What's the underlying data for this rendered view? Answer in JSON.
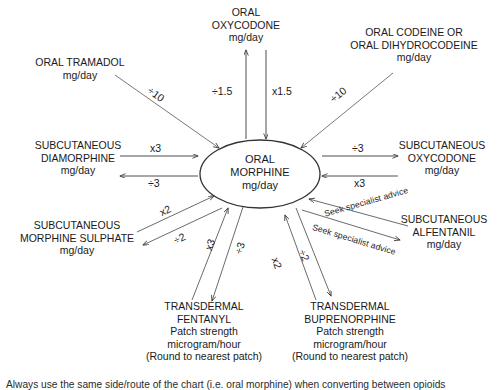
{
  "diagram": {
    "center": {
      "name": "oral-morphine",
      "text": "ORAL\nMORPHINE\nmg/day"
    },
    "nodes": [
      {
        "id": "oral-tramadol",
        "text": "ORAL TRAMADOL\nmg/day"
      },
      {
        "id": "oral-oxycodone",
        "text": "ORAL\nOXYCODONE\nmg/day"
      },
      {
        "id": "oral-codeine",
        "text": "ORAL CODEINE OR\nORAL DIHYDROCODEINE\nmg/day"
      },
      {
        "id": "subcutaneous-diamorphine",
        "text": "SUBCUTANEOUS\nDIAMORPHINE\nmg/day"
      },
      {
        "id": "subcutaneous-oxycodone",
        "text": "SUBCUTANEOUS\nOXYCODONE\nmg/day"
      },
      {
        "id": "subcutaneous-morphine-sulphate",
        "text": "SUBCUTANEOUS\nMORPHINE SULPHATE\nmg/day"
      },
      {
        "id": "subcutaneous-alfentanil",
        "text": "SUBCUTANEOUS\nALFENTANIL\nmg/day"
      },
      {
        "id": "transdermal-fentanyl",
        "text": "TRANSDERMAL\nFENTANYL\nPatch strength\nmicrogram/hour\n(Round to nearest patch)"
      },
      {
        "id": "transdermal-buprenorphine",
        "text": "TRANSDERMAL\nBUPRENORPHINE\nPatch strength\nmicrogram/hour\n(Round to nearest patch)"
      }
    ],
    "edge_labels": {
      "tramadol_to_morphine": "÷10",
      "codeine_to_morphine": "÷10",
      "oxycodone_to_morphine": "÷1.5",
      "morphine_to_oxycodone": "x1.5",
      "diamorphine_to_morphine": "x3",
      "morphine_to_diamorphine": "÷3",
      "morphine_to_sc_oxycodone": "÷3",
      "sc_oxycodone_to_morphine": "x3",
      "morphine_sulphate_to_morphine": "x2",
      "morphine_to_morphine_sulphate": "÷2",
      "fentanyl_to_morphine": "x3",
      "morphine_to_fentanyl": "÷3",
      "buprenorphine_to_morphine": "x2",
      "morphine_to_buprenorphine": "÷2",
      "alfentanil_to_morphine": "Seek specialist advice",
      "morphine_to_alfentanil": "Seek specialist advice"
    },
    "footnote": "Always use the same side/route of the chart (i.e. oral morphine) when converting between opioids"
  }
}
